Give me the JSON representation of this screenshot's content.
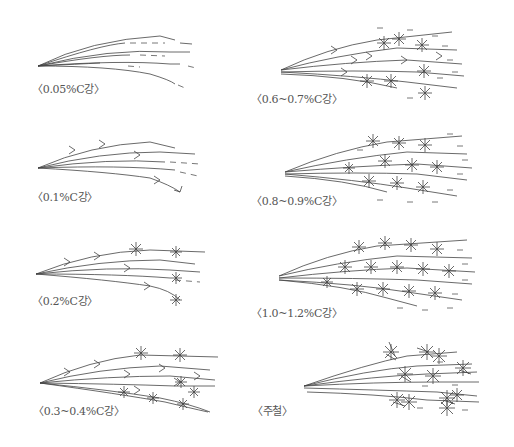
{
  "figure": {
    "panels": [
      {
        "id": "p1",
        "label": "〈0.05%C강〉",
        "type": "plain"
      },
      {
        "id": "p2",
        "label": "〈0.1%C강〉",
        "type": "forks"
      },
      {
        "id": "p3",
        "label": "〈0.2%C강〉",
        "type": "forks-few-stars"
      },
      {
        "id": "p4",
        "label": "〈0.3~0.4%C강〉",
        "type": "stars"
      },
      {
        "id": "p5",
        "label": "〈0.6~0.7%C강〉",
        "type": "dense"
      },
      {
        "id": "p6",
        "label": "〈0.8~0.9%C강〉",
        "type": "dense"
      },
      {
        "id": "p7",
        "label": "〈1.0~1.2%C강〉",
        "type": "very-dense"
      },
      {
        "id": "p8",
        "label": "〈주철〉",
        "type": "cast-iron"
      }
    ]
  }
}
